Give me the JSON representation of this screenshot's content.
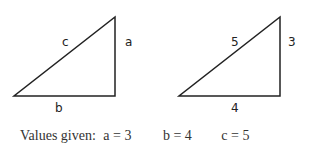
{
  "diagram": {
    "triangles": [
      {
        "name": "symbolic",
        "labels": {
          "hypotenuse": "c",
          "vertical": "a",
          "base": "b"
        }
      },
      {
        "name": "numeric",
        "labels": {
          "hypotenuse": "5",
          "vertical": "3",
          "base": "4"
        }
      }
    ]
  },
  "caption": {
    "prefix": "Values given:",
    "a": "a = 3",
    "b": "b = 4",
    "c": "c = 5"
  }
}
